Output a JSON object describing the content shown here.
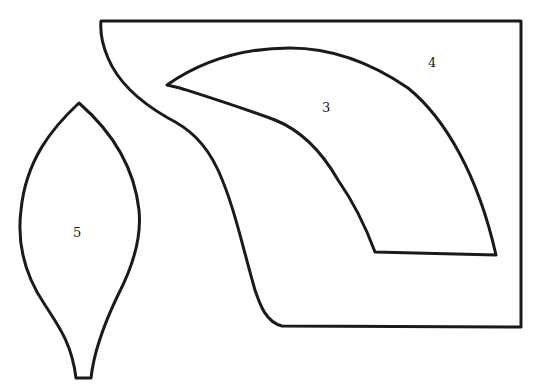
{
  "diagram": {
    "type": "pattern-pieces",
    "stroke_color": "#1a1a1a",
    "background": "#ffffff",
    "pieces": [
      {
        "id": "piece-3",
        "label": "3",
        "description": "curved horn/wing shape"
      },
      {
        "id": "piece-4",
        "label": "4",
        "description": "rectangle with curved left edge"
      },
      {
        "id": "piece-5",
        "label": "5",
        "description": "leaf/petal shape with stem"
      }
    ]
  }
}
